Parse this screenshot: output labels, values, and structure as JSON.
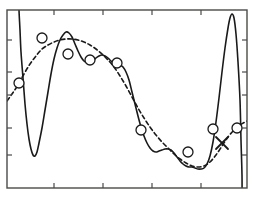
{
  "figure": {
    "title": "",
    "background_color": "#ffffff",
    "frame_color": "#4a4a47",
    "curve_color": "#1a1a1a",
    "marker_color": "#1a1a1a"
  },
  "axes": {
    "frame": {
      "left": 7,
      "top": 10,
      "right": 247,
      "bottom": 188
    },
    "x_ticks": [
      54,
      103,
      152,
      201
    ],
    "y_ticks": [
      40,
      72,
      95,
      128,
      155
    ],
    "x_tick_labels": [
      "",
      "",
      "",
      ""
    ],
    "y_tick_labels": [
      "",
      "",
      "",
      "",
      ""
    ],
    "xlabel": "",
    "ylabel": "",
    "grid": false,
    "tick_direction": "in",
    "ticks_on": [
      "left",
      "bottom",
      "top",
      "right"
    ]
  },
  "chart_data": {
    "type": "line",
    "title": "",
    "xlabel": "",
    "ylabel": "",
    "xlim": [
      0,
      1
    ],
    "ylim": [
      0,
      1
    ],
    "grid": false,
    "legend": "none",
    "series": [
      {
        "name": "overfit-polynomial",
        "style": "solid",
        "color": "#1a1a1a",
        "width": 1.6,
        "comment": "high-order fit: oscillates through every data point, diverges sharply at both ends",
        "points_px": [
          [
            19,
            0
          ],
          [
            19,
            10
          ],
          [
            20,
            30
          ],
          [
            21,
            52
          ],
          [
            23,
            78
          ],
          [
            25,
            104
          ],
          [
            27,
            124
          ],
          [
            29,
            139
          ],
          [
            31,
            149
          ],
          [
            33,
            155
          ],
          [
            35,
            156
          ],
          [
            37,
            152
          ],
          [
            39,
            143
          ],
          [
            42,
            128
          ],
          [
            45,
            110
          ],
          [
            48,
            92
          ],
          [
            51,
            74
          ],
          [
            54,
            59
          ],
          [
            57,
            48
          ],
          [
            60,
            40
          ],
          [
            63,
            35
          ],
          [
            66,
            32
          ],
          [
            69,
            33
          ],
          [
            72,
            37
          ],
          [
            75,
            44
          ],
          [
            78,
            51
          ],
          [
            81,
            57
          ],
          [
            84,
            61
          ],
          [
            87,
            63
          ],
          [
            90,
            63
          ],
          [
            93,
            61
          ],
          [
            96,
            58
          ],
          [
            99,
            56
          ],
          [
            102,
            55
          ],
          [
            105,
            56
          ],
          [
            108,
            58
          ],
          [
            111,
            61
          ],
          [
            114,
            63
          ],
          [
            117,
            64
          ],
          [
            120,
            65
          ],
          [
            123,
            67
          ],
          [
            126,
            72
          ],
          [
            129,
            80
          ],
          [
            132,
            92
          ],
          [
            135,
            104
          ],
          [
            138,
            116
          ],
          [
            141,
            127
          ],
          [
            144,
            136
          ],
          [
            147,
            143
          ],
          [
            150,
            148
          ],
          [
            153,
            151
          ],
          [
            156,
            152
          ],
          [
            159,
            151
          ],
          [
            162,
            150
          ],
          [
            165,
            149
          ],
          [
            168,
            149
          ],
          [
            171,
            150
          ],
          [
            174,
            153
          ],
          [
            177,
            157
          ],
          [
            180,
            161
          ],
          [
            183,
            164
          ],
          [
            186,
            166
          ],
          [
            189,
            167
          ],
          [
            192,
            167
          ],
          [
            195,
            168
          ],
          [
            198,
            169
          ],
          [
            201,
            169
          ],
          [
            204,
            168
          ],
          [
            207,
            164
          ],
          [
            210,
            156
          ],
          [
            213,
            142
          ],
          [
            216,
            122
          ],
          [
            219,
            98
          ],
          [
            222,
            72
          ],
          [
            225,
            48
          ],
          [
            228,
            28
          ],
          [
            230,
            18
          ],
          [
            232,
            14
          ],
          [
            234,
            18
          ],
          [
            236,
            34
          ],
          [
            238,
            62
          ],
          [
            240,
            100
          ],
          [
            241,
            140
          ],
          [
            242,
            175
          ],
          [
            242,
            201
          ]
        ]
      },
      {
        "name": "smooth-fit",
        "style": "dashed",
        "color": "#1a1a1a",
        "width": 1.6,
        "dash": "4,3",
        "comment": "lower-order / regularised fit: smooth broad arc through the data cloud",
        "points_px": [
          [
            7,
            101
          ],
          [
            12,
            94
          ],
          [
            18,
            85
          ],
          [
            24,
            74
          ],
          [
            30,
            64
          ],
          [
            36,
            56
          ],
          [
            42,
            49
          ],
          [
            48,
            45
          ],
          [
            54,
            42
          ],
          [
            60,
            40
          ],
          [
            66,
            39
          ],
          [
            72,
            39
          ],
          [
            78,
            40
          ],
          [
            84,
            42
          ],
          [
            90,
            45
          ],
          [
            96,
            49
          ],
          [
            102,
            54
          ],
          [
            108,
            60
          ],
          [
            114,
            67
          ],
          [
            120,
            76
          ],
          [
            126,
            86
          ],
          [
            132,
            97
          ],
          [
            138,
            108
          ],
          [
            144,
            118
          ],
          [
            150,
            127
          ],
          [
            156,
            135
          ],
          [
            162,
            142
          ],
          [
            168,
            148
          ],
          [
            174,
            154
          ],
          [
            180,
            159
          ],
          [
            186,
            163
          ],
          [
            192,
            166
          ],
          [
            198,
            167
          ],
          [
            204,
            166
          ],
          [
            210,
            162
          ],
          [
            216,
            155
          ],
          [
            222,
            146
          ],
          [
            228,
            137
          ],
          [
            234,
            130
          ],
          [
            240,
            125
          ],
          [
            247,
            121
          ]
        ]
      }
    ],
    "markers": [
      {
        "kind": "circle",
        "name": "data-point-1",
        "x": 19,
        "y": 83
      },
      {
        "kind": "circle",
        "name": "data-point-2",
        "x": 42,
        "y": 38
      },
      {
        "kind": "circle",
        "name": "data-point-3",
        "x": 68,
        "y": 54
      },
      {
        "kind": "circle",
        "name": "data-point-4",
        "x": 90,
        "y": 60
      },
      {
        "kind": "circle",
        "name": "data-point-5",
        "x": 117,
        "y": 63
      },
      {
        "kind": "circle",
        "name": "data-point-6",
        "x": 141,
        "y": 130
      },
      {
        "kind": "circle",
        "name": "data-point-7",
        "x": 188,
        "y": 152
      },
      {
        "kind": "circle",
        "name": "data-point-8",
        "x": 213,
        "y": 129
      },
      {
        "kind": "circle",
        "name": "data-point-9",
        "x": 237,
        "y": 128
      },
      {
        "kind": "cross",
        "name": "test-point-1",
        "x": 222,
        "y": 143
      }
    ],
    "marker_radius_px": 5,
    "cross_size_px": 6,
    "annotations": []
  }
}
